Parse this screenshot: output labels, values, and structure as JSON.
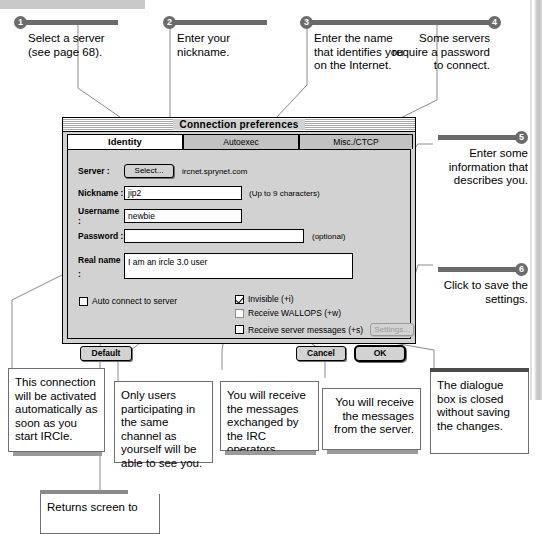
{
  "callouts_top": [
    {
      "num": "1",
      "text": "Select a server\n(see page 68).",
      "align": "left"
    },
    {
      "num": "2",
      "text": "Enter your\nnickname.",
      "align": "left"
    },
    {
      "num": "3",
      "text": "Enter the name\nthat identifies you\non the Internet.",
      "align": "left"
    },
    {
      "num": "4",
      "text": "Some servers\nrequire a password\nto connect.",
      "align": "right"
    }
  ],
  "callouts_right": [
    {
      "num": "5",
      "text": "Enter some\ninformation that\ndescribes you.",
      "align": "right"
    },
    {
      "num": "6",
      "text": "Click to save the\nsettings.",
      "align": "right"
    }
  ],
  "descriptions": [
    {
      "text": "This connection will be activated automatically as soon as you start IRCle.",
      "align": "left"
    },
    {
      "text": "Only users participating in the same channel as yourself will be able to see you.",
      "align": "left"
    },
    {
      "text": "You will receive the messages exchanged by the IRC operators.",
      "align": "left"
    },
    {
      "text": "You will receive the messages from the server.",
      "align": "right"
    },
    {
      "text": "The dialogue box is closed without saving the changes.",
      "align": "left"
    },
    {
      "text": "Returns screen to",
      "align": "left"
    }
  ],
  "dialog": {
    "title": "Connection preferences",
    "tabs": [
      {
        "label": "Identity",
        "active": true
      },
      {
        "label": "Autoexec",
        "active": false
      },
      {
        "label": "Misc./CTCP",
        "active": false
      }
    ],
    "fields": {
      "server_label": "Server :",
      "server_button": "Select...",
      "server_value": "ircnet.sprynet.com",
      "nickname_label": "Nickname :",
      "nickname_value": "jip2",
      "nickname_hint": "(Up to 9 characters)",
      "username_label": "Username :",
      "username_value": "newbie",
      "password_label": "Password :",
      "password_value": "",
      "password_hint": "(optional)",
      "realname_label": "Real name :",
      "realname_value": "I am an ircle 3.0 user"
    },
    "checkboxes": [
      {
        "label": "Auto connect to server",
        "checked": false
      },
      {
        "label": "Invisible (+i)",
        "checked": true
      },
      {
        "label": "Receive WALLOPS (+w)",
        "checked": false
      },
      {
        "label": "Receive server messages (+s)",
        "checked": false
      }
    ],
    "settings_button": "Settings...",
    "buttons": {
      "default": "Default",
      "cancel": "Cancel",
      "ok": "OK"
    }
  },
  "colors": {
    "accent_gray": "#6b6b6b",
    "dialog_face": "#d2d2d2",
    "leader_line": "#8a8a8a"
  }
}
